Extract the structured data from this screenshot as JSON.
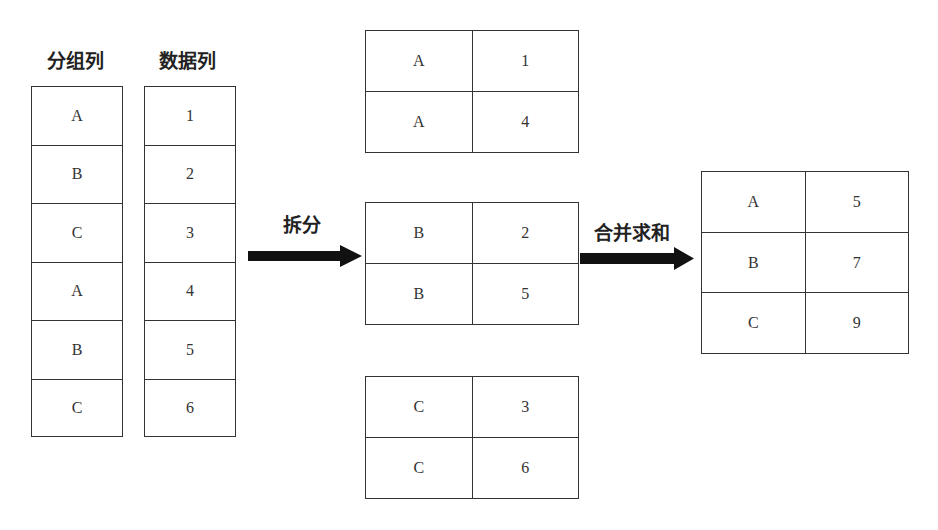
{
  "headers": {
    "group_column": "分组列",
    "data_column": "数据列"
  },
  "source": {
    "groups": [
      "A",
      "B",
      "C",
      "A",
      "B",
      "C"
    ],
    "values": [
      "1",
      "2",
      "3",
      "4",
      "5",
      "6"
    ]
  },
  "steps": {
    "split_label": "拆分",
    "combine_label": "合并求和"
  },
  "split_tables": [
    {
      "rows": [
        {
          "key": "A",
          "value": "1"
        },
        {
          "key": "A",
          "value": "4"
        }
      ]
    },
    {
      "rows": [
        {
          "key": "B",
          "value": "2"
        },
        {
          "key": "B",
          "value": "5"
        }
      ]
    },
    {
      "rows": [
        {
          "key": "C",
          "value": "3"
        },
        {
          "key": "C",
          "value": "6"
        }
      ]
    }
  ],
  "result_table": {
    "rows": [
      {
        "key": "A",
        "value": "5"
      },
      {
        "key": "B",
        "value": "7"
      },
      {
        "key": "C",
        "value": "9"
      }
    ]
  },
  "colors": {
    "border": "#333333",
    "arrow": "#111111",
    "background": "#ffffff"
  }
}
